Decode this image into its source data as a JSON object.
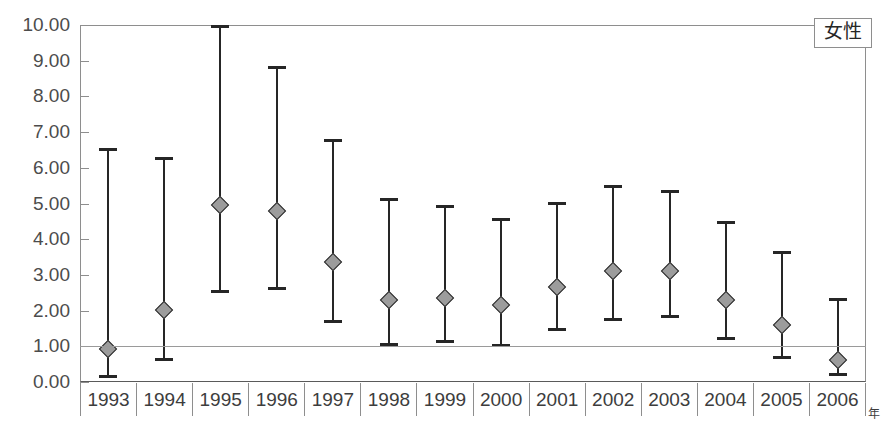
{
  "legend": {
    "label": "女性"
  },
  "axis": {
    "x_unit": "年",
    "y_ticks": [
      "0.00",
      "1.00",
      "2.00",
      "3.00",
      "4.00",
      "5.00",
      "6.00",
      "7.00",
      "8.00",
      "9.00",
      "10.00"
    ]
  },
  "chart_data": {
    "type": "scatter",
    "title": "",
    "subtitle": "",
    "xlabel": "年",
    "ylabel": "",
    "ylim": [
      0,
      10
    ],
    "yticks": [
      0,
      1,
      2,
      3,
      4,
      5,
      6,
      7,
      8,
      9,
      10
    ],
    "ytick_labels": [
      "0.00",
      "1.00",
      "2.00",
      "3.00",
      "4.00",
      "5.00",
      "6.00",
      "7.00",
      "8.00",
      "9.00",
      "10.00"
    ],
    "grid": "reference line at y = 1.00",
    "reference_line": 1.0,
    "legend_entries": [
      "女性"
    ],
    "legend_position": "top-right",
    "marker": "diamond",
    "error_bars": "vertical with caps (95% confidence interval)",
    "categories": [
      "1993",
      "1994",
      "1995",
      "1996",
      "1997",
      "1998",
      "1999",
      "2000",
      "2001",
      "2002",
      "2003",
      "2004",
      "2005",
      "2006"
    ],
    "series": [
      {
        "name": "女性",
        "values": [
          0.92,
          2.02,
          4.96,
          4.78,
          3.36,
          2.3,
          2.35,
          2.15,
          2.65,
          3.12,
          3.1,
          2.3,
          1.6,
          0.62
        ],
        "lower": [
          0.1,
          0.6,
          2.48,
          2.58,
          1.66,
          1.0,
          1.08,
          0.98,
          1.42,
          1.72,
          1.8,
          1.18,
          0.65,
          0.18
        ],
        "upper": [
          6.55,
          6.3,
          10.0,
          8.85,
          6.82,
          5.15,
          4.95,
          4.58,
          5.05,
          5.52,
          5.38,
          4.52,
          3.68,
          2.35
        ]
      }
    ]
  }
}
